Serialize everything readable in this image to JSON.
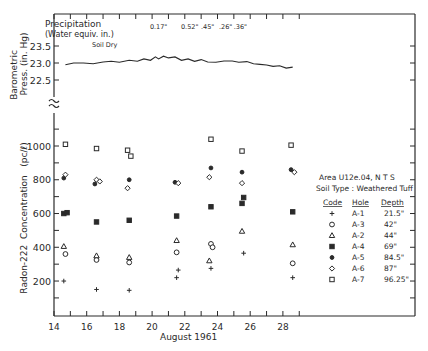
{
  "chart_data": {
    "type": "scatter",
    "title": "",
    "top_panel": {
      "ylabel_line1": "Barometric",
      "ylabel_line2": "Press. (in. Hg)",
      "yticks": [
        "23.5",
        "23.0",
        "22.5"
      ],
      "ylim": [
        22.5,
        23.5
      ],
      "precipitation_label_line1": "Precipitation",
      "precipitation_label_line2": "(Water equiv. in.)",
      "precipitation": [
        {
          "day": 20.4,
          "label": "0.17\""
        },
        {
          "day": 22.3,
          "label": "0.52\""
        },
        {
          "day": 23.4,
          "label": ".45\""
        },
        {
          "day": 24.5,
          "label": ".26\""
        },
        {
          "day": 25.4,
          "label": ".36\""
        }
      ],
      "annotation": "Soil Dry",
      "series": {
        "name": "Barometric Pressure",
        "x": [
          14.7,
          15.2,
          15.8,
          16.4,
          17.0,
          17.5,
          18.0,
          18.6,
          19.1,
          19.5,
          19.9,
          20.2,
          20.4,
          20.7,
          21.0,
          21.4,
          21.8,
          22.2,
          22.6,
          23.0,
          23.4,
          23.9,
          24.4,
          24.9,
          25.3,
          25.8,
          26.2,
          26.6,
          27.0,
          27.4,
          27.8,
          28.2,
          28.6
        ],
        "values": [
          22.95,
          23.0,
          23.0,
          22.98,
          23.03,
          23.05,
          23.02,
          23.08,
          23.05,
          23.12,
          23.08,
          23.18,
          23.12,
          23.2,
          23.15,
          23.18,
          23.08,
          23.12,
          23.05,
          23.1,
          23.03,
          23.02,
          23.06,
          23.06,
          23.02,
          23.04,
          22.98,
          22.96,
          22.94,
          22.9,
          22.92,
          22.85,
          22.88
        ]
      }
    },
    "main_panel": {
      "ylabel": "Radon-222  Concentration   (pc/ℓ)",
      "xlabel": "August 1961",
      "xticks": [
        "14",
        "16",
        "18",
        "20",
        "22",
        "24",
        "26",
        "28"
      ],
      "xlim": [
        14,
        29
      ],
      "yticks": [
        "200",
        "400",
        "600",
        "800",
        "1000"
      ],
      "ylim": [
        0,
        1200
      ],
      "grid": false,
      "legend_position": "right",
      "legend_title_line1": "Area U12e.04, N T S",
      "legend_title_line2": "Soil Type : Weathered Tuff",
      "legend_headers": [
        "Code",
        "Hole",
        "Depth"
      ],
      "series": [
        {
          "name": "A-1",
          "hole": "A-1",
          "depth": "21.5\"",
          "marker": "plus",
          "points": [
            [
              14.6,
              200
            ],
            [
              16.6,
              150
            ],
            [
              18.6,
              145
            ],
            [
              21.6,
              265
            ],
            [
              21.5,
              220
            ],
            [
              23.6,
              275
            ],
            [
              25.6,
              365
            ],
            [
              28.6,
              220
            ]
          ]
        },
        {
          "name": "A-3",
          "hole": "A-3",
          "depth": "42\"",
          "marker": "circle",
          "points": [
            [
              14.7,
              360
            ],
            [
              16.6,
              325
            ],
            [
              18.6,
              310
            ],
            [
              21.5,
              370
            ],
            [
              23.6,
              420
            ],
            [
              23.7,
              400
            ],
            [
              28.6,
              305
            ]
          ]
        },
        {
          "name": "A-2",
          "hole": "A-2",
          "depth": "44\"",
          "marker": "triangle",
          "points": [
            [
              14.6,
              405
            ],
            [
              16.6,
              350
            ],
            [
              18.6,
              340
            ],
            [
              21.5,
              440
            ],
            [
              23.5,
              320
            ],
            [
              25.5,
              495
            ],
            [
              28.6,
              415
            ]
          ]
        },
        {
          "name": "A-4",
          "hole": "A-4",
          "depth": "69\"",
          "marker": "filled-square",
          "points": [
            [
              14.6,
              600
            ],
            [
              14.8,
              605
            ],
            [
              16.6,
              550
            ],
            [
              18.6,
              560
            ],
            [
              21.5,
              585
            ],
            [
              23.6,
              640
            ],
            [
              25.6,
              695
            ],
            [
              25.5,
              660
            ],
            [
              28.6,
              610
            ]
          ]
        },
        {
          "name": "A-5",
          "hole": "A-5",
          "depth": "84.5\"",
          "marker": "filled-circle",
          "points": [
            [
              14.6,
              810
            ],
            [
              16.5,
              775
            ],
            [
              18.6,
              800
            ],
            [
              21.4,
              785
            ],
            [
              23.6,
              870
            ],
            [
              25.5,
              845
            ],
            [
              28.5,
              860
            ]
          ]
        },
        {
          "name": "A-6",
          "hole": "A-6",
          "depth": "87\"",
          "marker": "diamond",
          "points": [
            [
              14.7,
              830
            ],
            [
              16.6,
              800
            ],
            [
              16.8,
              790
            ],
            [
              18.5,
              750
            ],
            [
              21.6,
              780
            ],
            [
              23.5,
              815
            ],
            [
              25.5,
              780
            ],
            [
              28.7,
              845
            ]
          ]
        },
        {
          "name": "A-7",
          "hole": "A-7",
          "depth": "96.25\"",
          "marker": "square",
          "points": [
            [
              14.7,
              1010
            ],
            [
              16.6,
              985
            ],
            [
              18.5,
              975
            ],
            [
              18.7,
              940
            ],
            [
              23.6,
              1040
            ],
            [
              25.5,
              970
            ],
            [
              28.5,
              1005
            ]
          ]
        }
      ]
    }
  }
}
